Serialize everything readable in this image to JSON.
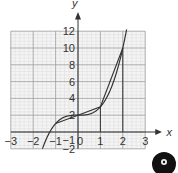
{
  "chart_data": {
    "type": "line",
    "title": "",
    "xlabel": "x",
    "ylabel": "y",
    "xlim": [
      -3,
      3
    ],
    "ylim": [
      -2,
      12
    ],
    "grid": true,
    "x_ticks": [
      "-3",
      "-2",
      "-1",
      "0",
      "1",
      "2",
      "3"
    ],
    "y_ticks": [
      "-2",
      "-1",
      "2",
      "4",
      "6",
      "8",
      "10",
      "12"
    ],
    "series": [
      {
        "name": "curve y = x^3 + 2",
        "x": [
          -1.75,
          -1.5,
          -1.25,
          -1,
          -0.5,
          0,
          0.5,
          1,
          1.5,
          2,
          2.17
        ],
        "y": [
          -3.36,
          -1.38,
          0.05,
          1,
          1.875,
          2,
          2.125,
          3,
          5.375,
          10,
          12.2
        ]
      },
      {
        "name": "secant segments",
        "x": [
          -1,
          0,
          1,
          2
        ],
        "y": [
          1,
          2,
          3,
          10
        ]
      }
    ],
    "vertical_guides": [
      1,
      2
    ],
    "colors": {
      "curve": "#333333",
      "grid": "#999999",
      "minor_grid": "#dddddd"
    }
  },
  "labels": {
    "x_axis": "x",
    "y_axis": "y"
  },
  "icon": {
    "name": "disc-icon"
  }
}
